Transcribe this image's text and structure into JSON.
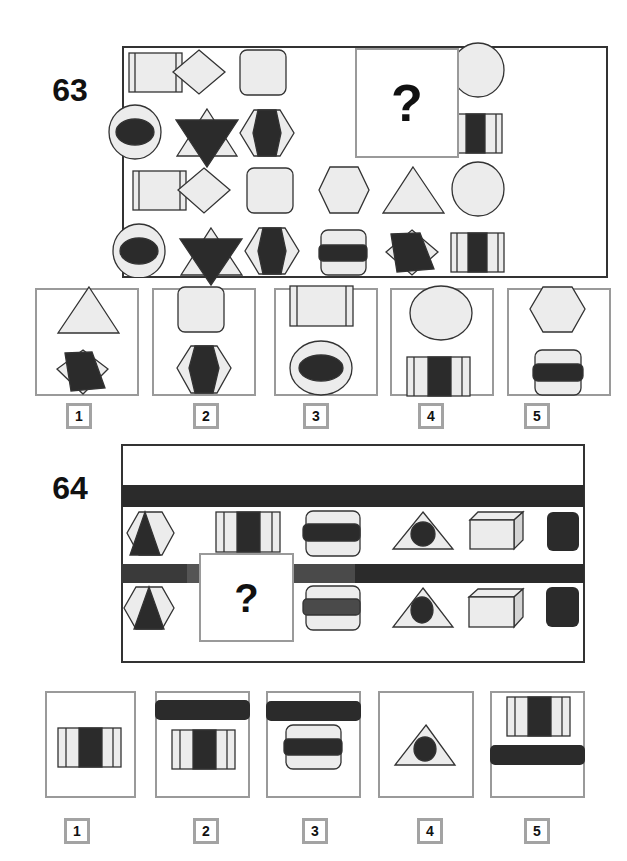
{
  "puzzles": [
    {
      "number": "63",
      "question_mark": "?",
      "grid": {
        "rows": [
          [
            "rect-with-side-bars",
            "diamond",
            "rounded-square",
            "missing",
            "triangle",
            "circle"
          ],
          [
            "circle-with-dark-ellipse",
            "star-of-david-dark-inverted-triangle",
            "hexagon-with-dark-elongated-hexagon",
            "missing",
            "diamond-with-dark-parallelogram",
            "rect-with-dark-center-stripe"
          ],
          [
            "rect-with-side-bars",
            "diamond",
            "rounded-square",
            "hexagon",
            "triangle",
            "circle"
          ],
          [
            "circle-with-dark-ellipse",
            "star-of-david-dark-inverted-triangle",
            "hexagon-with-dark-elongated-hexagon",
            "rounded-square-with-dark-bar",
            "diamond-with-dark-parallelogram",
            "rect-with-dark-center-stripe"
          ]
        ]
      },
      "options": [
        {
          "label": "1",
          "top": "triangle",
          "bottom": "diamond-with-dark-parallelogram"
        },
        {
          "label": "2",
          "top": "rounded-square",
          "bottom": "hexagon-with-dark-elongated-hexagon"
        },
        {
          "label": "3",
          "top": "rect-with-side-bars",
          "bottom": "circle-with-dark-ellipse"
        },
        {
          "label": "4",
          "top": "circle",
          "bottom": "rect-with-dark-center-stripe"
        },
        {
          "label": "5",
          "top": "hexagon",
          "bottom": "rounded-square-with-dark-bar"
        }
      ]
    },
    {
      "number": "64",
      "question_mark": "?",
      "grid": {
        "rows": [
          [
            "dark-bar-full-width"
          ],
          [
            "hexagon-with-dark-triangle",
            "rect-with-dark-center-stripe",
            "rounded-square-with-dark-bar",
            "triangle-with-dark-circle",
            "3d-box",
            "dark-rounded-square"
          ],
          [
            "dark-bar-segmented",
            "missing"
          ],
          [
            "hexagon-with-dark-triangle",
            "missing",
            "rounded-square-with-dark-bar",
            "triangle-with-dark-circle",
            "3d-box",
            "dark-rounded-square"
          ]
        ]
      },
      "options": [
        {
          "label": "1",
          "content": "rect-with-dark-center-stripe"
        },
        {
          "label": "2",
          "content": "dark-bar-above-rect-with-dark-center-stripe"
        },
        {
          "label": "3",
          "content": "dark-bar-above-rounded-square-with-dark-bar"
        },
        {
          "label": "4",
          "content": "triangle-with-dark-circle"
        },
        {
          "label": "5",
          "content": "rect-with-dark-center-stripe-above-dark-bar"
        }
      ]
    }
  ],
  "colors": {
    "shape_fill": "#ececec",
    "dark_fill": "#2b2b2b",
    "outline": "#333333",
    "box_border": "#9a9a9a"
  }
}
